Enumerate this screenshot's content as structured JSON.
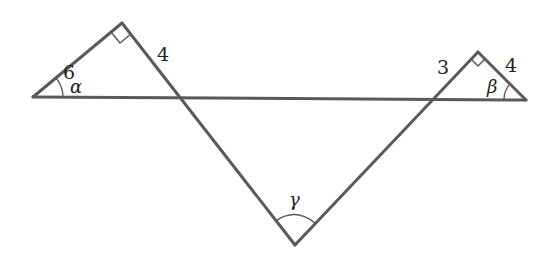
{
  "diagram": {
    "line_color": "#5a5a5a",
    "left_triangle": {
      "leg_labels": {
        "hypotenuse_side": "6",
        "right_side": "4"
      },
      "angle_label": "α",
      "right_angle_marker": true
    },
    "right_triangle": {
      "leg_labels": {
        "left_side": "3",
        "right_side": "4"
      },
      "angle_label": "β",
      "right_angle_marker": true
    },
    "bottom_angle": {
      "label": "γ"
    }
  }
}
